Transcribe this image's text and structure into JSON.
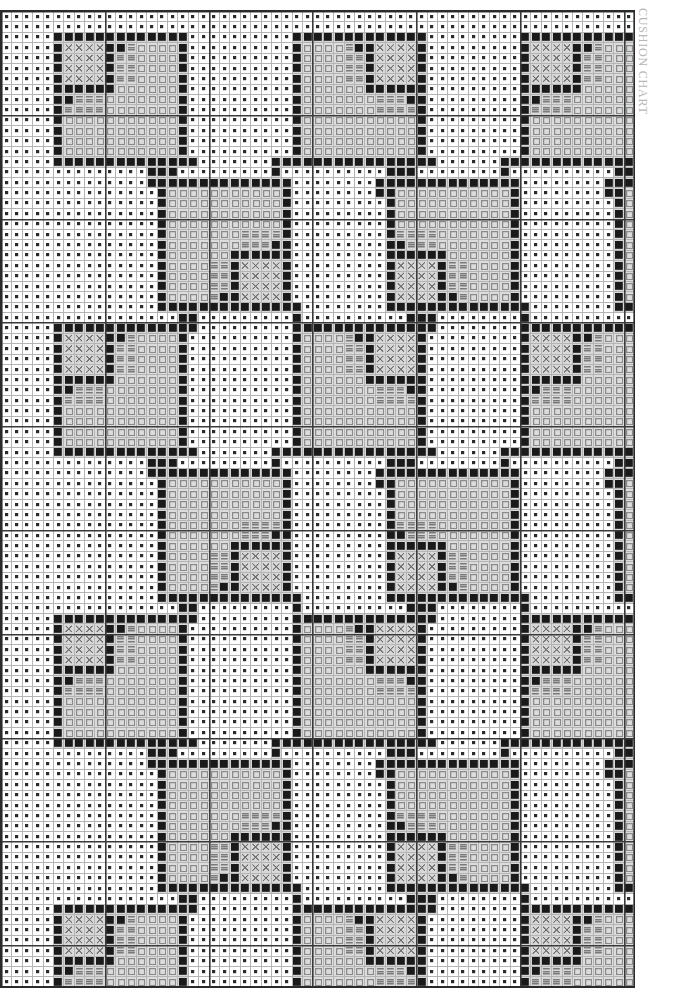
{
  "title": "CUSHION CHART",
  "document_type": "cross-stitch-chart",
  "canvas": {
    "width": 687,
    "height": 998,
    "background": "#ffffff"
  },
  "grid": {
    "origin_x": 0,
    "origin_y": 10,
    "cell_size": 10.38,
    "columns": 61,
    "rows": 94,
    "thin_line_color": "#b4b4b4",
    "thick_line_color": "#3a3a3a",
    "thick_line_every": 10,
    "thin_line_width": 1,
    "thick_line_width": 1.6,
    "border_color": "#2a2a2a"
  },
  "symbols": [
    {
      "key": "dot",
      "name": "small-filled-square",
      "description": "background stitch, small dark square centred in cell",
      "color": "#2b2b2b",
      "cell_fill": "#ffffff"
    },
    {
      "key": "solid",
      "name": "solid-filled-square",
      "description": "outline / dark border stitch, large filled square",
      "color": "#1a1a1a",
      "cell_fill": "#d6d6d6"
    },
    {
      "key": "cross",
      "name": "cross-x-symbol",
      "description": "X mark stitch",
      "color": "#6e6e6e",
      "cell_fill": "#d8d8d8"
    },
    {
      "key": "bars",
      "name": "horizontal-bars-symbol",
      "description": "stacked horizontal bars (equals) stitch",
      "color": "#7a7a7a",
      "cell_fill": "#d8d8d8"
    },
    {
      "key": "open",
      "name": "open-square-symbol",
      "description": "hollow outlined square stitch",
      "color": "#8a8a8a",
      "cell_fill": "#dcdcdc"
    },
    {
      "key": "blank",
      "name": "empty-cell",
      "description": "shaded empty cell inside motif",
      "color": "#c8c8c8",
      "cell_fill": "#d9d9d9"
    }
  ],
  "chart_data": {
    "type": "heatmap",
    "title": "CUSHION CHART",
    "xlabel": "",
    "ylabel": "",
    "grid": true,
    "legend": "none",
    "columns": 61,
    "rows": 94,
    "motif": {
      "name": "square-spiral-motif",
      "size": 13,
      "description": "13x13 square spiral: solid dark outline, inner spiral arm of solid cells, X-symbol block in one quadrant, horizontal-bar block adjacent, remainder filled with open squares"
    },
    "motif_layout": {
      "description": "Motifs tiled on an offset lattice, connected corner-to-corner by diagonal staircase lines of solid cells",
      "col_pitch": 23,
      "row_pitch": 28,
      "row_offset": 11,
      "placements": [
        {
          "col": 5,
          "row": 2,
          "flip_x": false,
          "flip_y": false
        },
        {
          "col": 28,
          "row": 2,
          "flip_x": true,
          "flip_y": false
        },
        {
          "col": 50,
          "row": 2,
          "flip_x": false,
          "flip_y": false
        },
        {
          "col": 15,
          "row": 16,
          "flip_x": true,
          "flip_y": true
        },
        {
          "col": 37,
          "row": 16,
          "flip_x": false,
          "flip_y": true
        },
        {
          "col": 59,
          "row": 16,
          "flip_x": true,
          "flip_y": true
        },
        {
          "col": 5,
          "row": 30,
          "flip_x": false,
          "flip_y": false
        },
        {
          "col": 28,
          "row": 30,
          "flip_x": true,
          "flip_y": false
        },
        {
          "col": 50,
          "row": 30,
          "flip_x": false,
          "flip_y": false
        },
        {
          "col": 15,
          "row": 44,
          "flip_x": true,
          "flip_y": true
        },
        {
          "col": 37,
          "row": 44,
          "flip_x": false,
          "flip_y": true
        },
        {
          "col": 59,
          "row": 44,
          "flip_x": true,
          "flip_y": true
        },
        {
          "col": 5,
          "row": 58,
          "flip_x": false,
          "flip_y": false
        },
        {
          "col": 28,
          "row": 58,
          "flip_x": true,
          "flip_y": false
        },
        {
          "col": 50,
          "row": 58,
          "flip_x": false,
          "flip_y": false
        },
        {
          "col": 15,
          "row": 72,
          "flip_x": true,
          "flip_y": true
        },
        {
          "col": 37,
          "row": 72,
          "flip_x": false,
          "flip_y": true
        },
        {
          "col": 59,
          "row": 72,
          "flip_x": true,
          "flip_y": true
        },
        {
          "col": 5,
          "row": 86,
          "flip_x": false,
          "flip_y": false
        },
        {
          "col": 28,
          "row": 86,
          "flip_x": true,
          "flip_y": false
        },
        {
          "col": 50,
          "row": 86,
          "flip_x": false,
          "flip_y": false
        }
      ]
    },
    "connector_lines": {
      "description": "Single-cell-wide diagonal staircase runs of solid stitches joining motif corners",
      "step_run": 2,
      "color": "#1a1a1a"
    }
  }
}
